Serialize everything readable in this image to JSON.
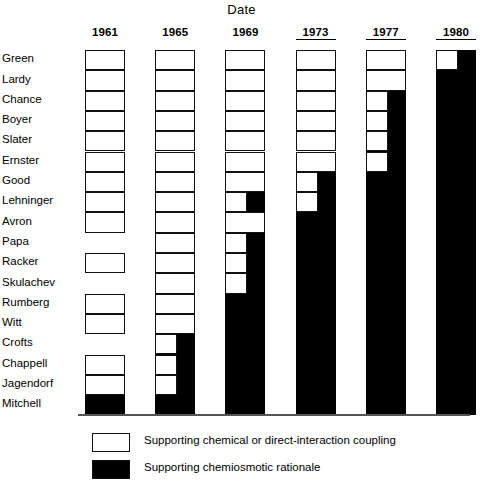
{
  "chart_data": {
    "type": "heatmap",
    "title": "Date",
    "xlabel": "Date",
    "ylabel": "",
    "grid": false,
    "legend_position": "bottom",
    "categories": [
      "1961",
      "1965",
      "1969",
      "1973",
      "1977",
      "1980"
    ],
    "rows": [
      "Green",
      "Lardy",
      "Chance",
      "Boyer",
      "Slater",
      "Ernster",
      "Good",
      "Lehninger",
      "Avron",
      "Papa",
      "Racker",
      "Skulachev",
      "Rumberg",
      "Witt",
      "Crofts",
      "Chappell",
      "Jagendorf",
      "Mitchell"
    ],
    "value_legend": {
      "white": "Supporting chemical or direct-interaction coupling",
      "black": "Supporting chemiosmotic rationale",
      "none": "No published position"
    },
    "cells": {
      "1961": [
        "white",
        "white",
        "white",
        "white",
        "white",
        "white",
        "white",
        "white",
        "white",
        "none",
        "white",
        "none",
        "white",
        "white",
        "none",
        "white",
        "white",
        "black"
      ],
      "1965": [
        "white",
        "white",
        "white",
        "white",
        "white",
        "white",
        "white",
        "white",
        "white",
        "white",
        "white",
        "white",
        "white",
        "white",
        "half-white",
        "half-white",
        "half-white",
        "black"
      ],
      "1969": [
        "white",
        "white",
        "white",
        "white",
        "white",
        "white",
        "white",
        "half-white",
        "white",
        "half-white",
        "half-white",
        "half-white",
        "black",
        "black",
        "black",
        "black",
        "black",
        "black"
      ],
      "1973": [
        "white",
        "white",
        "white",
        "white",
        "white",
        "white",
        "half-white",
        "half-white",
        "black",
        "black",
        "black",
        "black",
        "black",
        "black",
        "black",
        "black",
        "black",
        "black"
      ],
      "1977": [
        "white",
        "white",
        "half-white",
        "half-white",
        "half-white",
        "half-white",
        "black",
        "black",
        "black",
        "black",
        "black",
        "black",
        "black",
        "black",
        "black",
        "black",
        "black",
        "black"
      ],
      "1980": [
        "half-white",
        "black",
        "black",
        "black",
        "black",
        "black",
        "black",
        "black",
        "black",
        "black",
        "black",
        "black",
        "black",
        "black",
        "black",
        "black",
        "black",
        "black"
      ]
    },
    "series": [
      {
        "name": "1961",
        "white_count": 15,
        "black_count": 1,
        "absent_count": 2
      },
      {
        "name": "1965",
        "white_count": 17,
        "black_count": 1,
        "absent_count": 0
      },
      {
        "name": "1969",
        "white_count": 11,
        "black_count": 7,
        "absent_count": 0
      },
      {
        "name": "1973",
        "white_count": 8,
        "black_count": 10,
        "absent_count": 0
      },
      {
        "name": "1977",
        "white_count": 6,
        "black_count": 12,
        "absent_count": 0
      },
      {
        "name": "1980",
        "white_count": 1,
        "black_count": 17,
        "absent_count": 0
      }
    ]
  },
  "title": "Date",
  "years": [
    {
      "label": "1961",
      "underlined": false
    },
    {
      "label": "1965",
      "underlined": false
    },
    {
      "label": "1969",
      "underlined": false
    },
    {
      "label": "1973",
      "underlined": true
    },
    {
      "label": "1977",
      "underlined": true
    },
    {
      "label": "1980",
      "underlined": true
    }
  ],
  "row_labels": [
    "Green",
    "Lardy",
    "Chance",
    "Boyer",
    "Slater",
    "Ernster",
    "Good",
    "Lehninger",
    "Avron",
    "Papa",
    "Racker",
    "Skulachev",
    "Rumberg",
    "Witt",
    "Crofts",
    "Chappell",
    "Jagendorf",
    "Mitchell"
  ],
  "legend": [
    {
      "swatch": "empty",
      "text": "Supporting chemical or direct-interaction coupling"
    },
    {
      "swatch": "filled",
      "text": "Supporting chemiosmotic rationale"
    }
  ],
  "colors": {
    "white_cell": "#ffffff",
    "black_cell": "#000000",
    "outline": "#111111",
    "axis": "#555555"
  }
}
